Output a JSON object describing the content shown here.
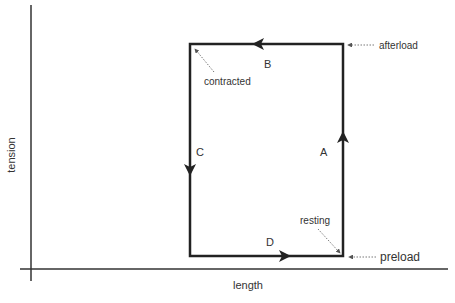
{
  "diagram": {
    "axes": {
      "x_label": "length",
      "y_label": "tension"
    },
    "segments": {
      "A": "A",
      "B": "B",
      "C": "C",
      "D": "D"
    },
    "annotations": {
      "afterload": "afterload",
      "contracted": "contracted",
      "resting": "resting",
      "preload": "preload"
    },
    "colors": {
      "line": "#222222",
      "axis": "#333333",
      "dotted": "#555555",
      "text": "#333333"
    }
  }
}
